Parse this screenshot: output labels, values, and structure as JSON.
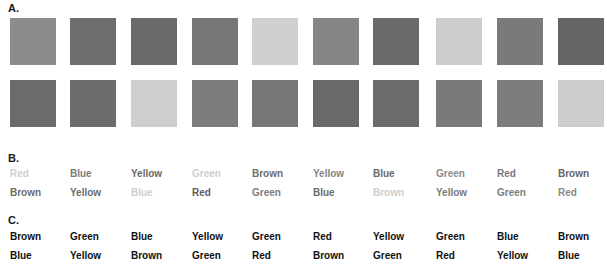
{
  "sections": {
    "a_label": "A.",
    "b_label": "B.",
    "c_label": "C."
  },
  "section_a": {
    "description": "Grayscale color patches",
    "rows": [
      [
        "#8c8c8c",
        "#6e6e6e",
        "#6a6a6a",
        "#767676",
        "#cfcfcf",
        "#858585",
        "#6a6a6a",
        "#cdcdcd",
        "#7a7a7a",
        "#656565"
      ],
      [
        "#6b6b6b",
        "#6c6c6c",
        "#cecece",
        "#7c7c7c",
        "#777777",
        "#6a6a6a",
        "#6b6b6b",
        "#7a7a7a",
        "#7c7c7c",
        "#cdcdcd"
      ]
    ]
  },
  "section_b": {
    "rows": [
      [
        {
          "text": "Red",
          "color": "#cfcfcf"
        },
        {
          "text": "Blue",
          "color": "#7c7c7c"
        },
        {
          "text": "Yellow",
          "color": "#6a6a6a"
        },
        {
          "text": "Green",
          "color": "#cdcdcd"
        },
        {
          "text": "Brown",
          "color": "#6e6e6e"
        },
        {
          "text": "Yellow",
          "color": "#858585"
        },
        {
          "text": "Blue",
          "color": "#6a6a6a"
        },
        {
          "text": "Green",
          "color": "#8a8a8a"
        },
        {
          "text": "Red",
          "color": "#7a7a7a"
        },
        {
          "text": "Brown",
          "color": "#656565"
        }
      ],
      [
        {
          "text": "Brown",
          "color": "#6b6b6b"
        },
        {
          "text": "Yellow",
          "color": "#6c6c6c"
        },
        {
          "text": "Blue",
          "color": "#cecece"
        },
        {
          "text": "Red",
          "color": "#5e5e5e"
        },
        {
          "text": "Green",
          "color": "#7c7c7c"
        },
        {
          "text": "Blue",
          "color": "#6a6a6a"
        },
        {
          "text": "Brown",
          "color": "#cdcdcd"
        },
        {
          "text": "Yellow",
          "color": "#7a7a7a"
        },
        {
          "text": "Green",
          "color": "#7c7c7c"
        },
        {
          "text": "Red",
          "color": "#8a8a8a"
        }
      ]
    ]
  },
  "section_c": {
    "rows": [
      [
        "Brown",
        "Green",
        "Blue",
        "Yellow",
        "Green",
        "Red",
        "Yellow",
        "Green",
        "Blue",
        "Brown"
      ],
      [
        "Blue",
        "Yellow",
        "Brown",
        "Green",
        "Red",
        "Brown",
        "Green",
        "Red",
        "Yellow",
        "Blue"
      ]
    ]
  }
}
